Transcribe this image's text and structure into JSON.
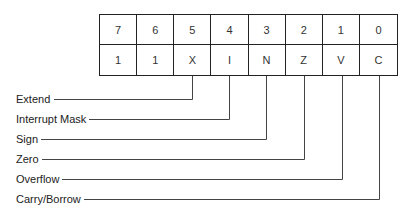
{
  "register": {
    "bit_numbers": [
      "7",
      "6",
      "5",
      "4",
      "3",
      "2",
      "1",
      "0"
    ],
    "bit_values": [
      "1",
      "1",
      "X",
      "I",
      "N",
      "Z",
      "V",
      "C"
    ]
  },
  "flags": [
    {
      "label": "Extend",
      "bit": 5
    },
    {
      "label": "Interrupt Mask",
      "bit": 4
    },
    {
      "label": "Sign",
      "bit": 3
    },
    {
      "label": "Zero",
      "bit": 2
    },
    {
      "label": "Overflow",
      "bit": 1
    },
    {
      "label": "Carry/Borrow",
      "bit": 0
    }
  ],
  "colors": {
    "line": "#444444",
    "border": "#222222"
  }
}
